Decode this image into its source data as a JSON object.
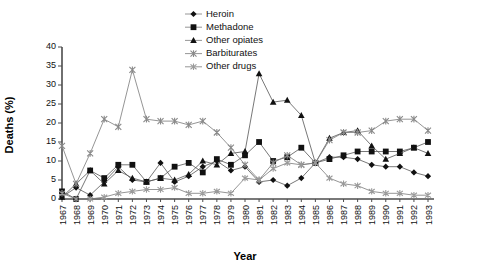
{
  "chart_data": {
    "type": "line",
    "title": "",
    "xlabel": "Year",
    "ylabel": "Deaths (%)",
    "ylim": [
      0,
      40
    ],
    "yticks": [
      0,
      5,
      10,
      15,
      20,
      25,
      30,
      35,
      40
    ],
    "grid": false,
    "legend_position": "top-right",
    "categories": [
      "1967",
      "1968",
      "1969",
      "1970",
      "1971",
      "1972",
      "1973",
      "1974",
      "1975",
      "1976",
      "1977",
      "1978",
      "1979",
      "1980",
      "1981",
      "1982",
      "1983",
      "1984",
      "1985",
      "1986",
      "1987",
      "1988",
      "1989",
      "1990",
      "1991",
      "1992",
      "1993"
    ],
    "series": [
      {
        "name": "Heroin",
        "marker": "diamond",
        "values": [
          0.5,
          3.0,
          1.0,
          4.5,
          8.5,
          5.0,
          4.5,
          9.5,
          4.5,
          6.0,
          8.5,
          10.0,
          7.5,
          8.5,
          4.5,
          5.0,
          3.5,
          5.5,
          9.5,
          11.0,
          11.0,
          10.5,
          9.0,
          8.5,
          8.5,
          7.0,
          6.0
        ]
      },
      {
        "name": "Methadone",
        "marker": "square",
        "values": [
          2.0,
          0.0,
          7.5,
          5.5,
          9.0,
          9.0,
          4.5,
          5.5,
          8.5,
          9.5,
          7.0,
          10.5,
          9.0,
          11.5,
          15.0,
          10.0,
          11.0,
          13.5,
          9.5,
          10.5,
          11.5,
          12.5,
          12.5,
          12.5,
          12.5,
          13.5,
          15.0
        ]
      },
      {
        "name": "Other opiates",
        "marker": "triangle",
        "values": [
          0.5,
          4.0,
          7.5,
          4.0,
          7.5,
          5.5,
          4.5,
          5.5,
          5.0,
          6.5,
          10.0,
          9.0,
          12.0,
          12.5,
          33.0,
          25.5,
          26.0,
          22.0,
          9.5,
          16.0,
          17.5,
          18.0,
          14.0,
          10.5,
          12.0,
          13.5,
          12.0
        ]
      },
      {
        "name": "Barbiturates",
        "marker": "cross",
        "values": [
          14.0,
          4.0,
          12.0,
          21.0,
          19.0,
          34.0,
          21.0,
          20.5,
          20.5,
          19.5,
          20.5,
          17.5,
          13.5,
          9.0,
          5.0,
          9.5,
          11.5,
          9.0,
          9.5,
          15.5,
          17.5,
          17.5,
          18.0,
          20.5,
          21.0,
          21.0,
          18.0
        ]
      },
      {
        "name": "Other drugs",
        "marker": "asterisk",
        "values": [
          1.5,
          0.0,
          0.0,
          0.5,
          1.5,
          2.0,
          2.5,
          2.5,
          3.0,
          1.5,
          1.5,
          2.0,
          1.5,
          5.5,
          5.0,
          8.0,
          9.5,
          9.0,
          9.5,
          5.5,
          4.0,
          3.5,
          2.0,
          1.5,
          1.5,
          1.0,
          1.0
        ]
      }
    ]
  },
  "legend": {
    "items": [
      {
        "label": "Heroin"
      },
      {
        "label": "Methadone"
      },
      {
        "label": "Other opiates"
      },
      {
        "label": "Barbiturates"
      },
      {
        "label": "Other drugs"
      }
    ]
  }
}
